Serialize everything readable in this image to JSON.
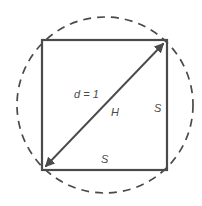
{
  "figure": {
    "background_color": "#ffffff",
    "stroke_color": "#4a4a4a",
    "labels": {
      "diagonal": "d = 1",
      "hypotenuse": "H",
      "side_right": "S",
      "side_bottom": "S"
    },
    "shapes": {
      "circle": {
        "name": "dashed-circumscribed-circle",
        "style": "dashed",
        "center_x": 105,
        "center_y": 105,
        "radius": 88,
        "dash_pattern": "8 6"
      },
      "square": {
        "name": "inscribed-square",
        "style": "solid",
        "left": 42,
        "top": 40,
        "right": 167,
        "bottom": 170
      },
      "diagonal_arrow": {
        "name": "double-headed-diagonal-arrow",
        "from_x": 42,
        "from_y": 170,
        "to_x": 167,
        "to_y": 40,
        "arrowheads": "both"
      }
    }
  }
}
